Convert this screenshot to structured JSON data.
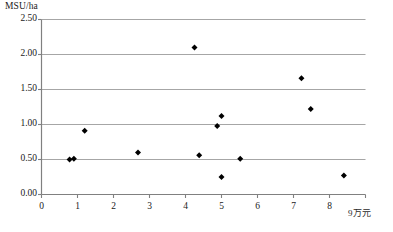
{
  "chart_data": {
    "type": "scatter",
    "title": "",
    "ylabel": "MSU/ha",
    "xlabel": "9万元",
    "x_unit_label": "9万元",
    "xlim": [
      0,
      9
    ],
    "ylim": [
      0,
      2.5
    ],
    "xticks": [
      "0",
      "1",
      "2",
      "3",
      "4",
      "5",
      "6",
      "7",
      "8",
      "9"
    ],
    "xtick_values": [
      0,
      1,
      2,
      3,
      4,
      5,
      6,
      7,
      8,
      9
    ],
    "yticks": [
      "0.00",
      "0.50",
      "1.00",
      "1.50",
      "2.00",
      "2.50"
    ],
    "ytick_values": [
      0,
      0.5,
      1.0,
      1.5,
      2.0,
      2.5
    ],
    "grid": "horizontal",
    "legend": "none",
    "marker": "diamond",
    "marker_color": "#000000",
    "gridline_color": "#a6a6a6",
    "axis_color": "#808080",
    "points": [
      {
        "x": 0.78,
        "y": 0.5
      },
      {
        "x": 0.9,
        "y": 0.51
      },
      {
        "x": 1.2,
        "y": 0.91
      },
      {
        "x": 2.68,
        "y": 0.6
      },
      {
        "x": 4.25,
        "y": 2.1
      },
      {
        "x": 4.38,
        "y": 0.56
      },
      {
        "x": 4.88,
        "y": 0.98
      },
      {
        "x": 5.0,
        "y": 1.12
      },
      {
        "x": 5.0,
        "y": 0.25
      },
      {
        "x": 5.52,
        "y": 0.51
      },
      {
        "x": 7.22,
        "y": 1.66
      },
      {
        "x": 7.48,
        "y": 1.22
      },
      {
        "x": 8.4,
        "y": 0.27
      }
    ]
  },
  "axis": {
    "y_axis_title": "MSU/ha",
    "x_axis_unit": "9万元"
  }
}
